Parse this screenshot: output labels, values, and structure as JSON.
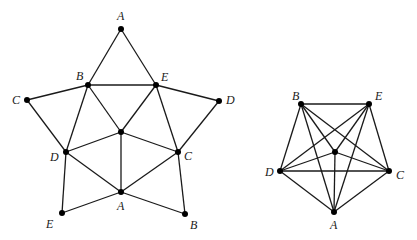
{
  "graphs": [
    {
      "id": "left",
      "nodes": [
        {
          "id": "A1",
          "label": "A",
          "x": 121,
          "y": 29,
          "lx": 117,
          "ly": 20
        },
        {
          "id": "B1",
          "label": "B",
          "x": 88,
          "y": 85,
          "lx": 76,
          "ly": 80
        },
        {
          "id": "E1",
          "label": "E",
          "x": 156,
          "y": 85,
          "lx": 161,
          "ly": 81
        },
        {
          "id": "C1",
          "label": "C",
          "x": 27,
          "y": 100,
          "lx": 12,
          "ly": 104
        },
        {
          "id": "D1",
          "label": "D",
          "x": 219,
          "y": 101,
          "lx": 226,
          "ly": 104
        },
        {
          "id": "X1",
          "label": "",
          "x": 121,
          "y": 132,
          "lx": 0,
          "ly": 0
        },
        {
          "id": "D2",
          "label": "D",
          "x": 66,
          "y": 152,
          "lx": 50,
          "ly": 161
        },
        {
          "id": "C2",
          "label": "C",
          "x": 178,
          "y": 152,
          "lx": 184,
          "ly": 160
        },
        {
          "id": "A2",
          "label": "A",
          "x": 121,
          "y": 192,
          "lx": 117,
          "ly": 210
        },
        {
          "id": "E2",
          "label": "E",
          "x": 62,
          "y": 213,
          "lx": 46,
          "ly": 228
        },
        {
          "id": "B2",
          "label": "B",
          "x": 185,
          "y": 214,
          "lx": 190,
          "ly": 229
        }
      ],
      "edges": [
        [
          "A1",
          "B1"
        ],
        [
          "A1",
          "E1"
        ],
        [
          "B1",
          "E1"
        ],
        [
          "B1",
          "C1"
        ],
        [
          "E1",
          "D1"
        ],
        [
          "C1",
          "D2"
        ],
        [
          "D1",
          "C2"
        ],
        [
          "B1",
          "D2"
        ],
        [
          "B1",
          "X1"
        ],
        [
          "E1",
          "X1"
        ],
        [
          "E1",
          "C2"
        ],
        [
          "D2",
          "X1"
        ],
        [
          "C2",
          "X1"
        ],
        [
          "X1",
          "A2"
        ],
        [
          "D2",
          "A2"
        ],
        [
          "C2",
          "A2"
        ],
        [
          "D2",
          "E2"
        ],
        [
          "E2",
          "A2"
        ],
        [
          "A2",
          "B2"
        ],
        [
          "B2",
          "C2"
        ]
      ]
    },
    {
      "id": "right",
      "nodes": [
        {
          "id": "B",
          "label": "B",
          "x": 301,
          "y": 104,
          "lx": 292,
          "ly": 100
        },
        {
          "id": "E",
          "label": "E",
          "x": 369,
          "y": 104,
          "lx": 375,
          "ly": 100
        },
        {
          "id": "X",
          "label": "",
          "x": 335,
          "y": 152,
          "lx": 0,
          "ly": 0
        },
        {
          "id": "D",
          "label": "D",
          "x": 280,
          "y": 171,
          "lx": 265,
          "ly": 176
        },
        {
          "id": "C",
          "label": "C",
          "x": 389,
          "y": 171,
          "lx": 396,
          "ly": 179
        },
        {
          "id": "A",
          "label": "A",
          "x": 334,
          "y": 212,
          "lx": 330,
          "ly": 229
        }
      ],
      "edges": [
        [
          "B",
          "E"
        ],
        [
          "B",
          "D"
        ],
        [
          "B",
          "C"
        ],
        [
          "B",
          "A"
        ],
        [
          "B",
          "X"
        ],
        [
          "E",
          "D"
        ],
        [
          "E",
          "C"
        ],
        [
          "E",
          "A"
        ],
        [
          "E",
          "X"
        ],
        [
          "D",
          "C"
        ],
        [
          "D",
          "A"
        ],
        [
          "D",
          "X"
        ],
        [
          "C",
          "A"
        ],
        [
          "C",
          "X"
        ],
        [
          "A",
          "X"
        ]
      ]
    }
  ]
}
